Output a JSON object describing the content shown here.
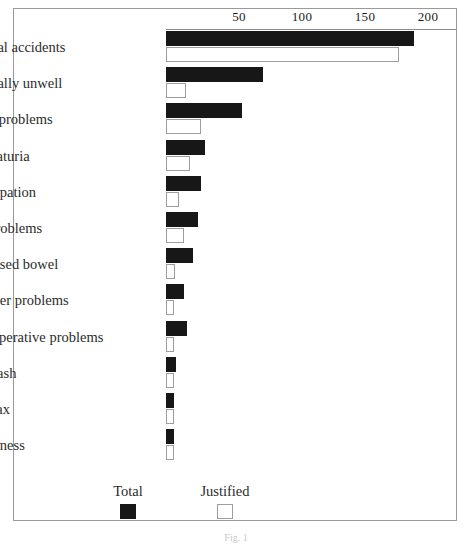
{
  "chart_data": {
    "type": "bar",
    "orientation": "horizontal",
    "title": "",
    "xlabel": "",
    "ylabel": "",
    "xlim": [
      0,
      230
    ],
    "ticks": [
      50,
      100,
      150,
      200
    ],
    "grid": false,
    "legend_position": "bottom",
    "categories": [
      "General accidents",
      "Generally unwell",
      "Chest problems",
      "Haematuria",
      "Constipation",
      "Eye problems",
      "Prolapsed bowel",
      "Catheter problems",
      "Post-operative problems",
      "Skin rash",
      "Ear wax",
      "Loneliness"
    ],
    "series": [
      {
        "name": "Total",
        "color": "#171717",
        "values": [
          196,
          77,
          60,
          31,
          28,
          25,
          21,
          14,
          17,
          8,
          6,
          6
        ]
      },
      {
        "name": "Justified",
        "color": "#ffffff",
        "values": [
          184,
          16,
          28,
          19,
          10,
          14,
          7,
          2,
          2,
          2,
          2,
          2
        ]
      }
    ]
  },
  "axis": {
    "tick_labels": [
      "50",
      "100",
      "150",
      "200"
    ]
  },
  "legend": {
    "items": [
      {
        "label": "Total",
        "swatch": "filled-black-square"
      },
      {
        "label": "Justified",
        "swatch": "outlined-white-square"
      }
    ]
  },
  "caption": {
    "text": "Fig. 1"
  }
}
